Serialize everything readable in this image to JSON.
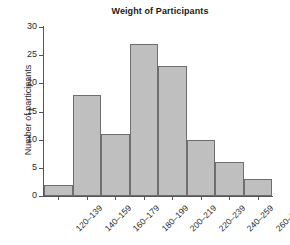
{
  "chart_data": {
    "type": "bar",
    "title": "Weight of Participants",
    "xlabel": "",
    "ylabel": "Number of participants",
    "categories": [
      "120–139",
      "140–159",
      "160–179",
      "180–199",
      "200–219",
      "220–239",
      "240–259",
      "260–279"
    ],
    "values": [
      2,
      18,
      11,
      27,
      23,
      10,
      6,
      3
    ],
    "ylim": [
      0,
      30
    ],
    "ytick_labels": [
      "0",
      "5",
      "10",
      "15",
      "20",
      "25",
      "30"
    ],
    "ytick_values": [
      0,
      5,
      10,
      15,
      20,
      25,
      30
    ],
    "grid": false,
    "legend": false,
    "bar_fill_color": "#bfbfbf",
    "bar_border_color": "#6e6e6e",
    "axis_color": "#555555",
    "background_color": "#ffffff"
  }
}
